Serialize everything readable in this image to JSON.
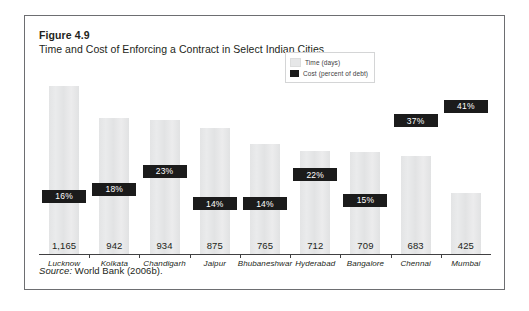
{
  "figure": {
    "number": "Figure 4.9",
    "title": "Time and Cost of Enforcing a Contract in Select Indian Cities",
    "source_label": "Source:",
    "source_text": " World Bank (2006b)."
  },
  "legend": {
    "time_label": "Time (days)",
    "cost_label": "Cost (percent of debt)"
  },
  "colors": {
    "time_bar": "#e6e7e8",
    "cost_band": "#1b1b1b",
    "frame": "#6d6e71",
    "axis": "#414042",
    "text": "#231f20"
  },
  "chart_data": {
    "type": "bar",
    "title": "Time and Cost of Enforcing a Contract in Select Indian Cities",
    "xlabel": "",
    "ylabel": "",
    "grid": false,
    "legend_position": "inside-top-right",
    "ylim": [
      0,
      1250
    ],
    "categories": [
      "Lucknow",
      "Kolkata",
      "Chandigarh",
      "Jaipur",
      "Bhubaneshwar",
      "Hyderabad",
      "Bangalore",
      "Chennai",
      "Mumbai"
    ],
    "series": [
      {
        "name": "Time (days)",
        "unit": "days",
        "values": [
          1165,
          942,
          934,
          875,
          765,
          712,
          709,
          683,
          425
        ],
        "labels": [
          "1,165",
          "942",
          "934",
          "875",
          "765",
          "712",
          "709",
          "683",
          "425"
        ]
      },
      {
        "name": "Cost (percent of debt)",
        "unit": "percent",
        "values": [
          16,
          18,
          23,
          14,
          14,
          22,
          15,
          37,
          41
        ],
        "labels": [
          "16%",
          "18%",
          "23%",
          "14%",
          "14%",
          "22%",
          "15%",
          "37%",
          "41%"
        ]
      }
    ]
  }
}
